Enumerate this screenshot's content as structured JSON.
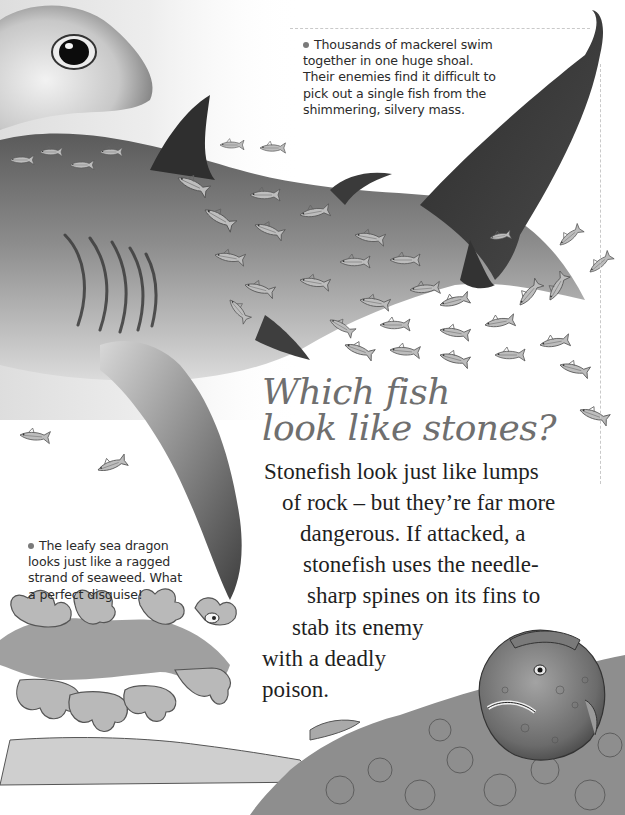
{
  "page": {
    "heading": {
      "lines": [
        "Which fish",
        "look like stones?"
      ]
    },
    "body": {
      "lines": [
        "Stonefish look just like lumps",
        "of rock – but they’re far more",
        "dangerous. If attacked, a",
        "stonefish uses the needle-",
        "sharp spines on its fins to",
        "stab its enemy",
        "with a deadly",
        "poison."
      ]
    },
    "facts": [
      {
        "topic": "mackerel",
        "bullet": "bullet-icon",
        "lines": [
          "Thousands of mackerel swim",
          "together in one huge shoal.",
          "Their enemies find it difficult to",
          "pick out a single fish from the",
          "shimmering, silvery mass."
        ]
      },
      {
        "topic": "leafy-sea-dragon",
        "bullet": "bullet-icon",
        "lines": [
          "The leafy sea dragon",
          "looks just like a ragged",
          "strand of seaweed. What",
          "a perfect disguise!"
        ]
      }
    ],
    "illustrations": [
      "hammerhead-shark-illustration",
      "mackerel-shoal-illustration",
      "leafy-sea-dragon-illustration",
      "stonefish-illustration",
      "seabed-rocks-illustration"
    ],
    "colors": {
      "background": "#ffffff",
      "heading": "#6f6f6f",
      "body_text": "#1f1f1f",
      "fact_text": "#2b2b2b",
      "shark_dark": "#3a3a3a",
      "shark_mid": "#8c8c8c"
    }
  }
}
